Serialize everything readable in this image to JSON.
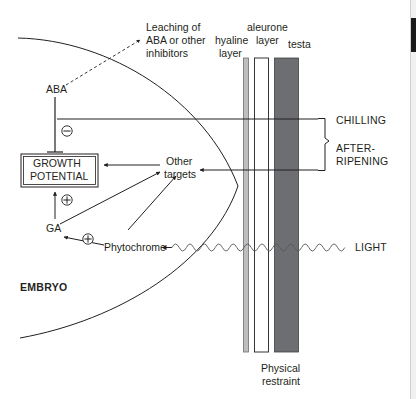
{
  "diagram": {
    "labels": {
      "leaching": "Leaching of\nABA or other\ninhibitors",
      "leaching_line1": "Leaching of",
      "leaching_line2": "ABA or other",
      "leaching_line3": "inhibitors",
      "aba": "ABA",
      "growth_potential_line1": "GROWTH",
      "growth_potential_line2": "POTENTIAL",
      "ga": "GA",
      "phytochrome": "Phytochrome",
      "other_targets_line1": "Other",
      "other_targets_line2": "targets",
      "embryo": "EMBRYO",
      "hyaline_line1": "hyaline",
      "hyaline_line2": "layer",
      "aleurone_line1": "aleurone",
      "aleurone_line2": "layer",
      "testa": "testa",
      "chilling": "CHILLING",
      "after_ripening_line1": "AFTER-",
      "after_ripening_line2": "RIPENING",
      "light": "LIGHT",
      "physical_line1": "Physical",
      "physical_line2": "restraint"
    },
    "symbols": {
      "minus": "–",
      "plus_growth": "+",
      "plus_ga": "+"
    },
    "colors": {
      "ink": "#231f20",
      "hyaline_fill": "#bcbec0",
      "aleurone_fill": "#ffffff",
      "testa_fill": "#6d6e71",
      "background": "#ffffff",
      "scrollbar_track": "#f1f1f1",
      "scrollbar_thumb": "#1a1a1a"
    }
  }
}
